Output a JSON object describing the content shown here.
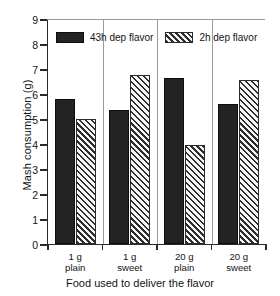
{
  "chart_data": {
    "type": "bar",
    "title": "",
    "xlabel": "Food used to deliver the flavor",
    "ylabel": "Mash consumption (g)",
    "ylim": [
      0,
      9
    ],
    "ytick_labels": [
      "0",
      "1",
      "2",
      "3",
      "4",
      "5",
      "6",
      "7",
      "8",
      "9"
    ],
    "ytick_values": [
      0,
      1,
      2,
      3,
      4,
      5,
      6,
      7,
      8,
      9
    ],
    "grid": false,
    "legend_position": "top-inside",
    "categories": [
      "1 g plain",
      "1 g sweet",
      "20 g plain",
      "20 g sweet"
    ],
    "category_lines": [
      [
        "1 g",
        "plain"
      ],
      [
        "1 g",
        "sweet"
      ],
      [
        "20 g",
        "plain"
      ],
      [
        "20 g",
        "sweet"
      ]
    ],
    "series": [
      {
        "name": "43h dep flavor",
        "fill": "solid",
        "color": "#232323",
        "values": [
          5.8,
          5.35,
          6.65,
          5.6
        ]
      },
      {
        "name": "2h dep flavor",
        "fill": "diagonal-hatch",
        "color": "#2e2e2e",
        "values": [
          5.0,
          6.75,
          3.95,
          6.55
        ]
      }
    ]
  },
  "legend": {
    "items": [
      {
        "label": "43h dep flavor"
      },
      {
        "label": "2h dep flavor"
      }
    ]
  }
}
